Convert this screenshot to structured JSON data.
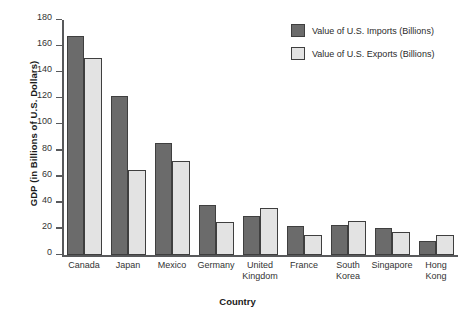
{
  "chart_data": {
    "type": "bar",
    "title": "",
    "xlabel": "Country",
    "ylabel": "GDP (in Billions of U.S. Dollars)",
    "ylim": [
      0,
      180
    ],
    "ytick_step": 20,
    "yticks": [
      0,
      20,
      40,
      60,
      80,
      100,
      120,
      140,
      160,
      180
    ],
    "grid": false,
    "legend_position": "top-right",
    "categories": [
      "Canada",
      "Japan",
      "Mexico",
      "Germany",
      "United Kingdom",
      "France",
      "South Korea",
      "Singapore",
      "Hong Kong"
    ],
    "series": [
      {
        "name": "Value of U.S. Imports (Billions)",
        "color": "#6b6b6b",
        "values": [
          168,
          122,
          86,
          38,
          30,
          22,
          23,
          21,
          11
        ]
      },
      {
        "name": "Value of U.S. Exports (Billions)",
        "color": "#e3e3e3",
        "values": [
          151,
          65,
          72,
          25,
          36,
          15,
          26,
          18,
          15
        ]
      }
    ]
  },
  "colors": {
    "imports": "#6b6b6b",
    "exports": "#e3e3e3",
    "axis": "#58595b",
    "bar_border": "#3f3f3f",
    "background": "#ffffff"
  }
}
